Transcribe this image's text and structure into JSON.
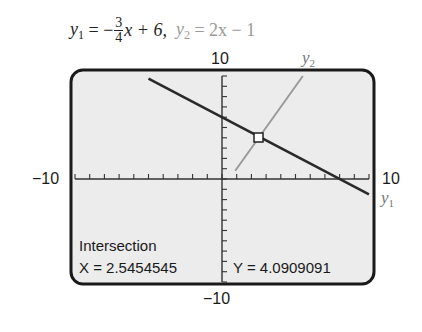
{
  "equation": {
    "y1_label": "y",
    "y1_sub": "1",
    "y1_eq_prefix": "= −",
    "y1_frac_num": "3",
    "y1_frac_den": "4",
    "y1_eq_suffix": "x + 6,",
    "y2_label": "y",
    "y2_sub": "2",
    "y2_eq": "= 2x − 1"
  },
  "window": {
    "xmin_label": "−10",
    "xmax_label": "10",
    "ymax_label": "10",
    "ymin_label": "−10"
  },
  "curve_labels": {
    "y1": "y",
    "y1_sub": "1",
    "y2": "y",
    "y2_sub": "2"
  },
  "readout": {
    "title": "Intersection",
    "x_text": "X = 2.5454545",
    "y_text": "Y = 4.0909091"
  },
  "colors": {
    "screen_bg": "#ececec",
    "frame": "#1a1a1a",
    "y1_line": "#2a2a2a",
    "y2_line": "#9a9a9a",
    "axis": "#333333"
  },
  "chart_data": {
    "type": "line",
    "xlabel": "",
    "ylabel": "",
    "xlim": [
      -10,
      10
    ],
    "ylim": [
      -10,
      10
    ],
    "xscl": 1,
    "yscl": 1,
    "grid": false,
    "series": [
      {
        "name": "y1",
        "slope": -0.75,
        "intercept": 6,
        "x": [
          -5.0,
          10.0
        ],
        "y": [
          9.75,
          -1.5
        ]
      },
      {
        "name": "y2",
        "slope": 2,
        "intercept": -1,
        "x": [
          -3.0,
          5.5
        ],
        "y": [
          -7.0,
          10.0
        ]
      }
    ],
    "annotations": [
      {
        "text": "Intersection",
        "x": 2.5454545,
        "y": 4.0909091
      }
    ]
  }
}
